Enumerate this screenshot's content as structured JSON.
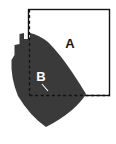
{
  "figure": {
    "type": "geometry-diagram",
    "width": 116,
    "height": 144,
    "background_color": "#ffffff"
  },
  "square": {
    "label": "A",
    "stroke_color": "#141414",
    "fill_color": "#ffffff",
    "stroke_width": 1.4,
    "x": 28.5,
    "y": 9.5,
    "width": 81,
    "height": 86
  },
  "shape": {
    "label": "B",
    "fill_color": "#3a3a3a",
    "path": "M 30 33 L 30 39 L 24 39 L 24 33 L 19.5 34 L 19.5 44 L 14.5 45 L 14.5 55 L 11.5 60 Q 10.5 78 18 96 Q 30 116 46 127 Q 60 120 72 110 Q 82 101 86 94 Q 80 84 72 72 Q 60 54 48 42 Q 39 35 30 33 Z"
  },
  "labels": {
    "a": {
      "text": "A",
      "x": 70,
      "y": 45,
      "color": "#151515"
    },
    "b": {
      "text": "B",
      "x": 41,
      "y": 78,
      "color": "#ffffff"
    }
  },
  "dashed_lines": {
    "stroke_color": "#111111",
    "stroke_width": 1.3,
    "dash_pattern": "3,2.6",
    "vertical": {
      "name": "vertical-dashed-line",
      "x1": 29.5,
      "y1": 9.5,
      "x2": 29.5,
      "y2": 95.5
    },
    "horizontal": {
      "name": "horizontal-dashed-line",
      "x1": 29.5,
      "y1": 95.5,
      "x2": 109.5,
      "y2": 95.5
    }
  },
  "tick_mark": {
    "name": "corner-tick-mark",
    "stroke_color": "#ffffff",
    "stroke_width": 1.1,
    "x1": 42,
    "y1": 84,
    "x2": 48,
    "y2": 91
  }
}
